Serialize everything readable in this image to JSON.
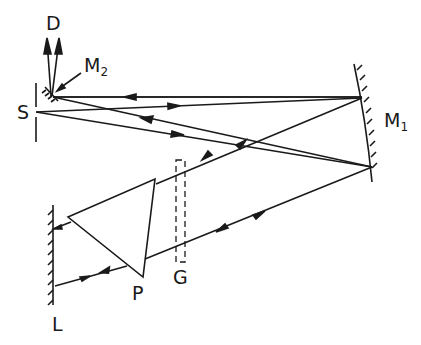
{
  "diagram": {
    "type": "optical-setup",
    "labels": {
      "D": "D",
      "M2": "M",
      "M2_sub": "2",
      "S": "S",
      "M1": "M",
      "M1_sub": "1",
      "G": "G",
      "P": "P",
      "L": "L"
    },
    "components": [
      {
        "id": "S",
        "name": "entrance-slit"
      },
      {
        "id": "M2",
        "name": "plane-mirror"
      },
      {
        "id": "M1",
        "name": "concave-mirror"
      },
      {
        "id": "P",
        "name": "prism"
      },
      {
        "id": "L",
        "name": "littrow-mirror"
      },
      {
        "id": "G",
        "name": "dashed-element"
      },
      {
        "id": "D",
        "name": "detector-output"
      }
    ],
    "colors": {
      "line": "#1a1a1a",
      "background": "#ffffff"
    }
  }
}
